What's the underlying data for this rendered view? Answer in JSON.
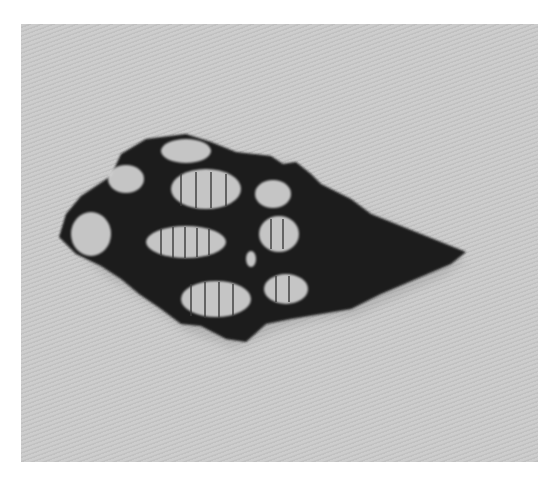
{
  "image": {
    "subject": "gastropod shell specimen",
    "background_color": "#c8c8c8",
    "border_color": "#ffffff",
    "shell_dark_color": "#1a1a1a",
    "shell_light_color": "#d8d8d8"
  }
}
